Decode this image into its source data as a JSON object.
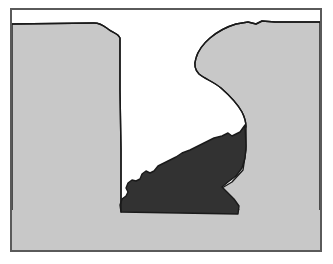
{
  "figure": {
    "title": "Geological cross-section illustration",
    "caption": "",
    "canvas": {
      "width": 333,
      "height": 264
    },
    "colors": {
      "background": "#ffffff",
      "void": "#ffffff",
      "rock_light": "#c8c8c8",
      "rock_dark": "#323232",
      "outline": "#1a1a1a",
      "frame": "#5a5a5a"
    },
    "frame": {
      "x": 10,
      "y": 8,
      "width": 312,
      "height": 244,
      "stroke_width": 2
    },
    "regions": [
      {
        "name": "left-rock-mass",
        "label": "Left wall",
        "fill": "#c8c8c8",
        "stroke": "#1a1a1a",
        "path": "M 12 251 L 12 24 L 94 23 C 101 23 104 26 108 29 C 113 33 118 33 120 38 L 120 90 L 121 150 L 121 200 L 121 212 L 12 212 Z"
      },
      {
        "name": "right-rock-mass",
        "label": "Right wall",
        "fill": "#c8c8c8",
        "stroke": "#1a1a1a",
        "path": "M 320 22 L 275 22 L 262 21 L 256 24 L 248 22 L 236 24 C 226 27 217 32 210 38 C 203 44 198 51 196 58 C 194 64 195 70 199 74 C 205 79 214 82 221 88 C 229 95 237 103 242 112 C 245 118 246 122 246 127 L 246 150 L 243 170 L 232 182 L 222 188 L 229 197 L 236 205 L 240 212 L 320 212 Z"
      },
      {
        "name": "dark-rubble-mass",
        "label": "Dark debris cone",
        "fill": "#323232",
        "stroke": "#1a1a1a",
        "path": "M 245 125 L 240 132 L 232 136 L 228 133 L 222 136 L 214 138 L 206 142 L 198 146 L 190 150 L 182 153 L 176 157 L 170 160 L 164 163 L 158 166 L 154 171 L 150 173 L 146 171 L 142 174 L 140 179 L 136 181 L 132 180 L 128 183 L 126 188 L 128 192 L 126 196 L 122 199 L 120 205 L 121 212 L 238 214 L 239 206 L 234 199 L 227 192 L 222 187 L 228 182 L 236 176 L 242 168 L 245 158 L 246 146 Z"
      }
    ],
    "white_void": {
      "name": "open-void",
      "label": "Excavated void / open space"
    }
  }
}
